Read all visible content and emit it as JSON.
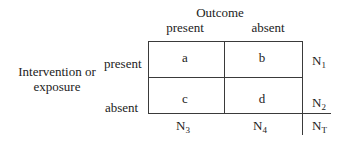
{
  "header": {
    "outcome_label": "Outcome",
    "columns": [
      {
        "label": "present"
      },
      {
        "label": "absent"
      }
    ]
  },
  "row_header": {
    "title_line1": "Intervention or",
    "title_line2": "exposure",
    "rows": [
      {
        "label": "present"
      },
      {
        "label": "absent"
      }
    ]
  },
  "cells": [
    [
      "a",
      "b"
    ],
    [
      "c",
      "d"
    ]
  ],
  "row_totals": [
    {
      "base": "N",
      "sub": "1"
    },
    {
      "base": "N",
      "sub": "2"
    }
  ],
  "column_totals": [
    {
      "base": "N",
      "sub": "3"
    },
    {
      "base": "N",
      "sub": "4"
    }
  ],
  "grand_total": {
    "base": "N",
    "sub": "T"
  }
}
